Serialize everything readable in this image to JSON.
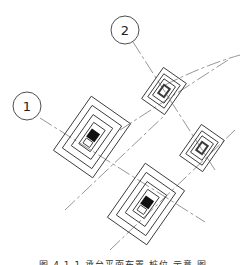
{
  "diagram": {
    "type": "foundation-pile-layout-plan",
    "axis_bubbles": [
      {
        "label": "1",
        "cx": 27,
        "cy": 106
      },
      {
        "label": "2",
        "cx": 125,
        "cy": 30
      }
    ],
    "colors": {
      "line": "#3a3a3a",
      "axis": "#8a8a8a",
      "background": "#ffffff"
    }
  },
  "caption": {
    "text": "图 4.1.1  承台平面布置 桩位 示意 图"
  }
}
